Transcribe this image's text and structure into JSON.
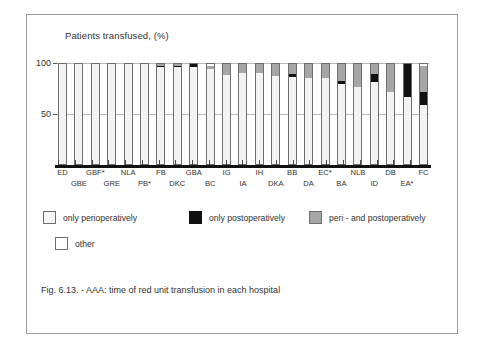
{
  "figure": {
    "caption": "Fig. 6.13. -  AAA: time of red unit transfusion in each hospital"
  },
  "chart_data": {
    "type": "bar",
    "subtype": "stacked-bar",
    "title": "Patients transfused,  (%)",
    "xlabel": "",
    "ylabel": "",
    "ylim": [
      0,
      100
    ],
    "yticks": [
      50,
      100
    ],
    "ytick_labels": [
      "50",
      "100"
    ],
    "grid": true,
    "legend_position": "below-plot",
    "categories": [
      "ED",
      "GBE",
      "GBF*",
      "GRE",
      "NLA",
      "PB*",
      "FB",
      "DKC",
      "GBA",
      "BC",
      "IG",
      "IA",
      "IH",
      "DKA",
      "BB",
      "DA",
      "EC*",
      "BA",
      "NLB",
      "ID",
      "DB",
      "EA*",
      "FC"
    ],
    "series": [
      {
        "name": "only perioperatively",
        "color": "#f3f3f3",
        "values": [
          100,
          100,
          100,
          100,
          100,
          100,
          96,
          96,
          96,
          94,
          88,
          90,
          90,
          87,
          86,
          85,
          85,
          79,
          76,
          81,
          72,
          67,
          59
        ]
      },
      {
        "name": "only postoperatively",
        "color": "#111111",
        "values": [
          0,
          0,
          0,
          0,
          0,
          0,
          1,
          1,
          4,
          0,
          0,
          0,
          0,
          0,
          3,
          0,
          0,
          3,
          0,
          8,
          0,
          33,
          13
        ]
      },
      {
        "name": "peri - and postoperatively",
        "color": "#a6a6a6",
        "values": [
          0,
          0,
          0,
          0,
          0,
          0,
          3,
          3,
          0,
          3,
          12,
          10,
          10,
          13,
          11,
          15,
          15,
          18,
          24,
          11,
          28,
          0,
          25
        ]
      },
      {
        "name": "other",
        "color": "#ffffff",
        "values": [
          0,
          0,
          0,
          0,
          0,
          0,
          0,
          0,
          0,
          3,
          0,
          0,
          0,
          0,
          0,
          0,
          0,
          0,
          0,
          0,
          0,
          0,
          3
        ]
      }
    ]
  },
  "legend": {
    "items": [
      {
        "label": "only perioperatively",
        "swatch": "peri"
      },
      {
        "label": "only postoperatively",
        "swatch": "post"
      },
      {
        "label": "peri - and postoperatively",
        "swatch": "both"
      },
      {
        "label": "other",
        "swatch": "other"
      }
    ]
  }
}
